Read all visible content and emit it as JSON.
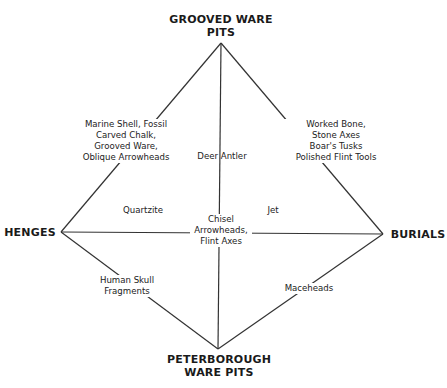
{
  "diagram": {
    "type": "diamond-relationship",
    "colors": {
      "line": "#333333",
      "text": "#222222",
      "background": "#ffffff"
    },
    "nodes": {
      "top": {
        "lines": [
          "GROOVED WARE",
          "PITS"
        ]
      },
      "left": {
        "lines": [
          "HENGES"
        ]
      },
      "right": {
        "lines": [
          "BURIALS"
        ]
      },
      "bottom": {
        "lines": [
          "PETERBOROUGH",
          "WARE PITS"
        ]
      }
    },
    "edge_labels": {
      "top_left": {
        "lines": [
          "Marine Shell, Fossil",
          "Carved Chalk,",
          "Grooved Ware,",
          "Oblique Arrowheads"
        ]
      },
      "top_right": {
        "lines": [
          "Worked Bone,",
          "Stone Axes",
          "Boar's Tusks",
          "Polished Flint Tools"
        ]
      },
      "top_bottom": {
        "lines": [
          "Deer Antler"
        ]
      },
      "left_bottom": {
        "lines": [
          "Human Skull",
          "Fragments"
        ]
      },
      "right_bottom": {
        "lines": [
          "Maceheads"
        ]
      },
      "left_right_center": {
        "lines": [
          "Chisel",
          "Arrowheads,",
          "Flint Axes"
        ]
      }
    },
    "region_labels": {
      "upper_left": {
        "lines": [
          "Quartzite"
        ]
      },
      "upper_right": {
        "lines": [
          "Jet"
        ]
      }
    }
  }
}
